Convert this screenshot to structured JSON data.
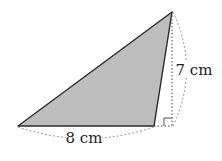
{
  "diagram": {
    "type": "triangle-area",
    "fill_color": "#bdbdbd",
    "stroke_color": "#2a2a2a",
    "base_label": "8 cm",
    "height_label": "7 cm",
    "right_angle_marker": true,
    "vertices": {
      "A": [
        18,
        126
      ],
      "B": [
        154,
        126
      ],
      "C": [
        172,
        12
      ],
      "D_foot": [
        172,
        126
      ]
    }
  }
}
